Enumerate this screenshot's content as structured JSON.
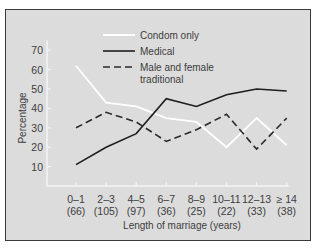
{
  "chart_data": {
    "type": "line",
    "title": "",
    "xlabel": "Length of marriage (years)",
    "ylabel": "Percentage",
    "ylim": [
      0,
      75
    ],
    "yticks": [
      10,
      20,
      30,
      40,
      50,
      60,
      70
    ],
    "grid": false,
    "legend_position": "top-right inside",
    "categories": [
      "0-1",
      "2-3",
      "4-5",
      "6-7",
      "8-9",
      "10-11",
      "12-13",
      "≥ 14"
    ],
    "category_counts": [
      "(66)",
      "(105)",
      "(97)",
      "(36)",
      "(25)",
      "(22)",
      "(33)",
      "(38)"
    ],
    "series": [
      {
        "name": "Condom only",
        "style": "solid-white",
        "values": [
          62,
          43,
          41,
          35,
          33,
          20,
          35,
          21
        ]
      },
      {
        "name": "Medical",
        "style": "solid-black",
        "values": [
          11,
          20,
          27,
          45,
          41,
          47,
          50,
          49
        ]
      },
      {
        "name": "Male and female traditional",
        "style": "dashed-black",
        "values": [
          30,
          38,
          33,
          23,
          29,
          37,
          19,
          35
        ]
      }
    ]
  },
  "legend": {
    "items": [
      {
        "label_line1": "Condom only",
        "label_line2": ""
      },
      {
        "label_line1": "Medical",
        "label_line2": ""
      },
      {
        "label_line1": "Male and female",
        "label_line2": "traditional"
      }
    ]
  },
  "colors": {
    "background": "#dcdcdc",
    "frame": "#3a3a3a",
    "condom_line": "#ffffff",
    "medical_line": "#1e1e1e",
    "traditional_line": "#2a2a2a",
    "axis": "#f4f4f4",
    "text": "#3c3c3c"
  }
}
